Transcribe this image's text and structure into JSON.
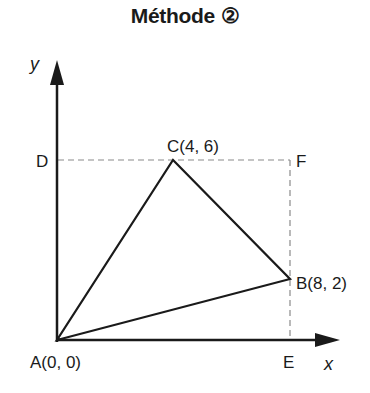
{
  "title": "Méthode ②",
  "axes": {
    "x_label": "x",
    "y_label": "y"
  },
  "points": {
    "A": {
      "label": "A(0, 0)",
      "x": 0,
      "y": 0
    },
    "B": {
      "label": "B(8, 2)",
      "x": 8,
      "y": 2
    },
    "C": {
      "label": "C(4, 6)",
      "x": 4,
      "y": 6
    },
    "D": {
      "label": "D",
      "x": 0,
      "y": 6
    },
    "E": {
      "label": "E",
      "x": 8,
      "y": 0
    },
    "F": {
      "label": "F",
      "x": 8,
      "y": 6
    }
  },
  "shapes": {
    "triangle": [
      "A",
      "B",
      "C"
    ],
    "dashed_rectangle": [
      "D",
      "F",
      "E"
    ]
  },
  "colors": {
    "stroke": "#1a1a1a",
    "dashed": "#888888"
  }
}
